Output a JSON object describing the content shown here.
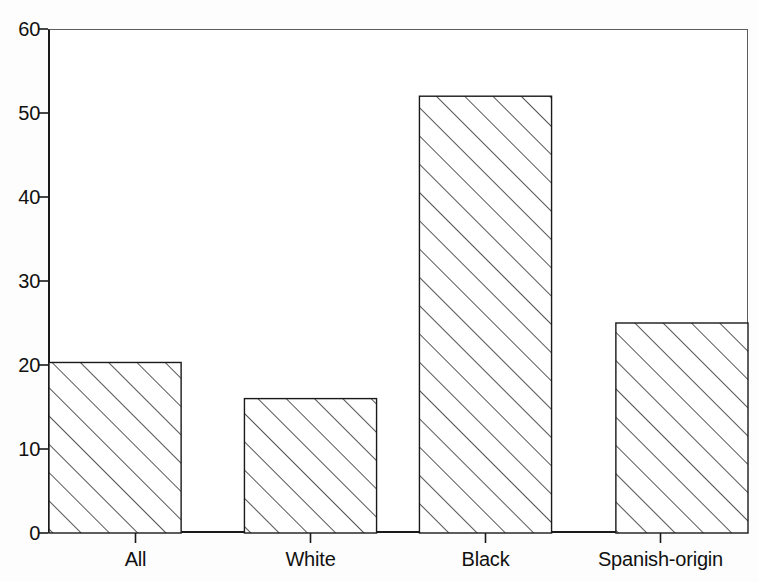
{
  "chart_data": {
    "type": "bar",
    "title": "",
    "subtitle": "",
    "xlabel": "",
    "ylabel": "",
    "categories": [
      "All",
      "White",
      "Black",
      "Spanish-origin"
    ],
    "values": [
      20.3,
      16.0,
      52.0,
      25.0
    ],
    "series": [
      {
        "name": "",
        "values": [
          20.3,
          16.0,
          52.0,
          25.0
        ]
      }
    ],
    "ylim": [
      0,
      60
    ],
    "yticks": [
      0,
      10,
      20,
      30,
      40,
      50,
      60
    ],
    "ytick_labels": [
      "0",
      "10",
      "20",
      "30",
      "40",
      "50",
      "60"
    ],
    "xtick_labels": [
      "All",
      "White",
      "Black",
      "Spanish-origin"
    ],
    "grid": false,
    "legend": null,
    "legend_position": "none",
    "bar_style": {
      "fill": "#ffffff",
      "edge_color": "#1a1a1a",
      "hatch": "diagonal-45",
      "hatch_color": "#2b2b2b"
    },
    "axis_color": "#1a1a1a",
    "frame_color": "#5d5d5d",
    "background": "#ffffff"
  },
  "figure": {
    "plot_left_px": 48,
    "plot_top_px": 29,
    "plot_width_px": 700,
    "plot_height_px": 504
  }
}
